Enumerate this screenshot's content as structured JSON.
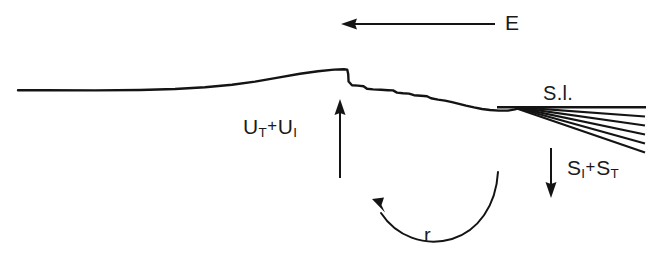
{
  "figure": {
    "type": "geological-cross-section",
    "background_color": "#ffffff",
    "line_color": "#141414",
    "width": 653,
    "height": 260
  },
  "labels": {
    "erosion": {
      "text": "E",
      "meaning": "erosion",
      "arrow_direction": "left"
    },
    "uplift": {
      "symbol_1": "U",
      "subscript_1": "T",
      "operator": "+",
      "symbol_2": "U",
      "subscript_2": "I",
      "plain_text": "UT + UI",
      "meaning": "tectonic uplift plus isostatic uplift",
      "arrow_direction": "up"
    },
    "sea_level": {
      "text": "S.l.",
      "meaning": "sea level"
    },
    "sedimentation": {
      "symbol_1": "S",
      "subscript_1": "I",
      "operator": "+",
      "symbol_2": "S",
      "subscript_2": "T",
      "plain_text": "SI + ST",
      "meaning": "isostatic plus tectonic subsidence",
      "arrow_direction": "down"
    },
    "rebound": {
      "text": "r",
      "meaning": "flexural response / rebound",
      "arrow_direction": "counterclockwise-up-left"
    }
  },
  "geometry": {
    "topography_profile": "M18,90 L40,90 L120,90.5 L190,88 L230,85 L265,79 L300,73 L327,70 L345,69.5 L348,70 L349,82 L352,85 L362,86 L368,89 L380,90 L392,90.5 L398,93 L410,94 L418,96 L428,96.5 L436,99 L448,101 L460,104 L470,107 L482,109 L495,110.5 L510,110.5 L520,108",
    "sea_level_line": "M497,107 L646,107",
    "fan_apex": [
      520,
      107
    ],
    "fan_rays": 5,
    "fan_end_x": 645,
    "fan_end_y_values": [
      116,
      125,
      134,
      143,
      152
    ],
    "erosion_arrow": {
      "x1": 495,
      "y1": 24,
      "x2": 343,
      "y2": 24
    },
    "uplift_arrow": {
      "x1": 340,
      "y1": 178,
      "x2": 340,
      "y2": 100
    },
    "sedimentation_arrow": {
      "x1": 551,
      "y1": 148,
      "x2": 551,
      "y2": 197
    },
    "rebound_arc": "M497,175 C492,222 455,243 420,240 C392,238 374,222 366,200"
  }
}
